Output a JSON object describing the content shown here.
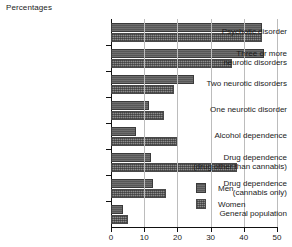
{
  "chart_data": {
    "type": "bar",
    "orientation": "horizontal",
    "title": "Percentages",
    "xlabel": "",
    "ylabel": "",
    "xlim": [
      0,
      50
    ],
    "xticks": [
      0,
      10,
      20,
      30,
      40,
      50
    ],
    "grid": true,
    "legend_position": "inside-bottom-right",
    "categories": [
      "Psychotic disorder",
      "Three or more neurotic disorders",
      "Two neurotic disorders",
      "One neurotic disorder",
      "Alcohol dependence",
      "Drug dependence (drug other than cannabis)",
      "Drug dependence (cannabis only)",
      "General population"
    ],
    "category_lines": [
      [
        "Psychotic disorder"
      ],
      [
        "Three or more",
        "neurotic disorders"
      ],
      [
        "Two neurotic disorders"
      ],
      [
        "One neurotic disorder"
      ],
      [
        "Alcohol dependence"
      ],
      [
        "Drug dependence",
        "(drug other than cannabis)"
      ],
      [
        "Drug dependence",
        "(cannabis only)"
      ],
      [
        "General population"
      ]
    ],
    "series": [
      {
        "name": "Men",
        "color": "#575757",
        "values": [
          45.5,
          46,
          25,
          11.5,
          7.5,
          12,
          12.5,
          3.5
        ]
      },
      {
        "name": "Women",
        "color": "#8c8c8c",
        "values": [
          45.5,
          36.5,
          19,
          16,
          20,
          38,
          16.5,
          5
        ]
      }
    ]
  },
  "legend": {
    "items": [
      {
        "label": "Men"
      },
      {
        "label": "Women"
      }
    ]
  },
  "axis": {
    "tick_labels": [
      "0",
      "10",
      "20",
      "30",
      "40",
      "50"
    ]
  }
}
